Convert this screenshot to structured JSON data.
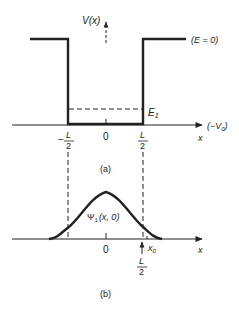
{
  "figure_a": {
    "y_axis_label": "V(x)",
    "energy_zero_label": "(E = 0)",
    "well_bottom_label": "(−V",
    "well_bottom_sub": "0",
    "well_bottom_close": ")",
    "energy_level_label": "E",
    "energy_level_sub": "1",
    "x_axis_label": "x",
    "ticks": {
      "left_minus": "−",
      "left_num": "L",
      "left_den": "2",
      "center": "0",
      "right_num": "L",
      "right_den": "2"
    },
    "caption": "(a)"
  },
  "figure_b": {
    "curve_label": "Ψ",
    "curve_sub": "1",
    "curve_args": "(x, 0)",
    "center_tick": "0",
    "x0_label": "x",
    "x0_sub": "0",
    "marker_num": "L",
    "marker_den": "2",
    "x_axis_label": "x",
    "caption": "(b)"
  },
  "colors": {
    "ink": "#222222",
    "background": "#ffffff"
  }
}
